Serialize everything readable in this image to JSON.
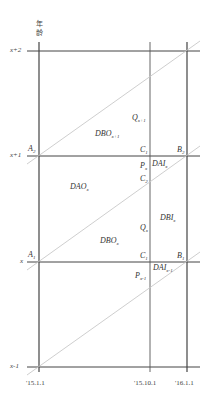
{
  "diagram": {
    "type": "lexis-diagram",
    "y_axis_title": [
      "年",
      "龄"
    ],
    "y_ticks": [
      "x+2",
      "x+1",
      "x",
      "x-1"
    ],
    "x_ticks": [
      "'15.1.1",
      "'15.10.1",
      "'16.1.1"
    ],
    "points": {
      "A2": {
        "base": "A",
        "sub": "2"
      },
      "A1": {
        "base": "A",
        "sub": "1"
      },
      "B2": {
        "base": "B",
        "sub": "2"
      },
      "B1": {
        "base": "B",
        "sub": "1"
      },
      "C1": {
        "base": "C",
        "sub": "1"
      },
      "C2": {
        "base": "C",
        "sub": "2"
      },
      "C1b": {
        "base": "C",
        "sub": "1"
      },
      "Px": {
        "base": "P",
        "sub": "x"
      },
      "Px1": {
        "base": "P",
        "sub": "x-1"
      }
    },
    "regions": {
      "Qx1": {
        "base": "Q",
        "sub": "x+1"
      },
      "DBOx1": {
        "base": "DBO",
        "sub": "x+1"
      },
      "DAOx": {
        "base": "DAO",
        "sub": "x"
      },
      "DBOx": {
        "base": "DBO",
        "sub": "x"
      },
      "Qx": {
        "base": "Q",
        "sub": "x"
      },
      "DBIx": {
        "base": "DBI",
        "sub": "x"
      },
      "DAIx": {
        "base": "DAI",
        "sub": "x"
      },
      "DAIx1": {
        "base": "DAI",
        "sub": "x-1"
      }
    },
    "colors": {
      "axis": "#444444",
      "diagonal": "#c8c8c8"
    }
  }
}
